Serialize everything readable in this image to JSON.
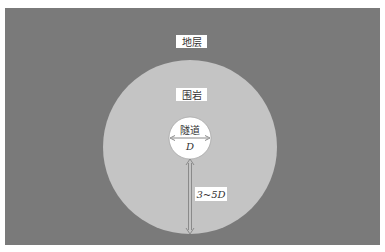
{
  "diagram": {
    "labels": {
      "stratum": "地层",
      "surrounding_rock": "围岩",
      "tunnel": "隧道",
      "diameter": "D",
      "range": "3~5D"
    },
    "colors": {
      "stratum": "#7a7a7a",
      "surrounding_rock": "#c4c4c4",
      "tunnel": "#ffffff",
      "label_bg": "#ffffff",
      "arrow": "#8a8a8a"
    }
  }
}
